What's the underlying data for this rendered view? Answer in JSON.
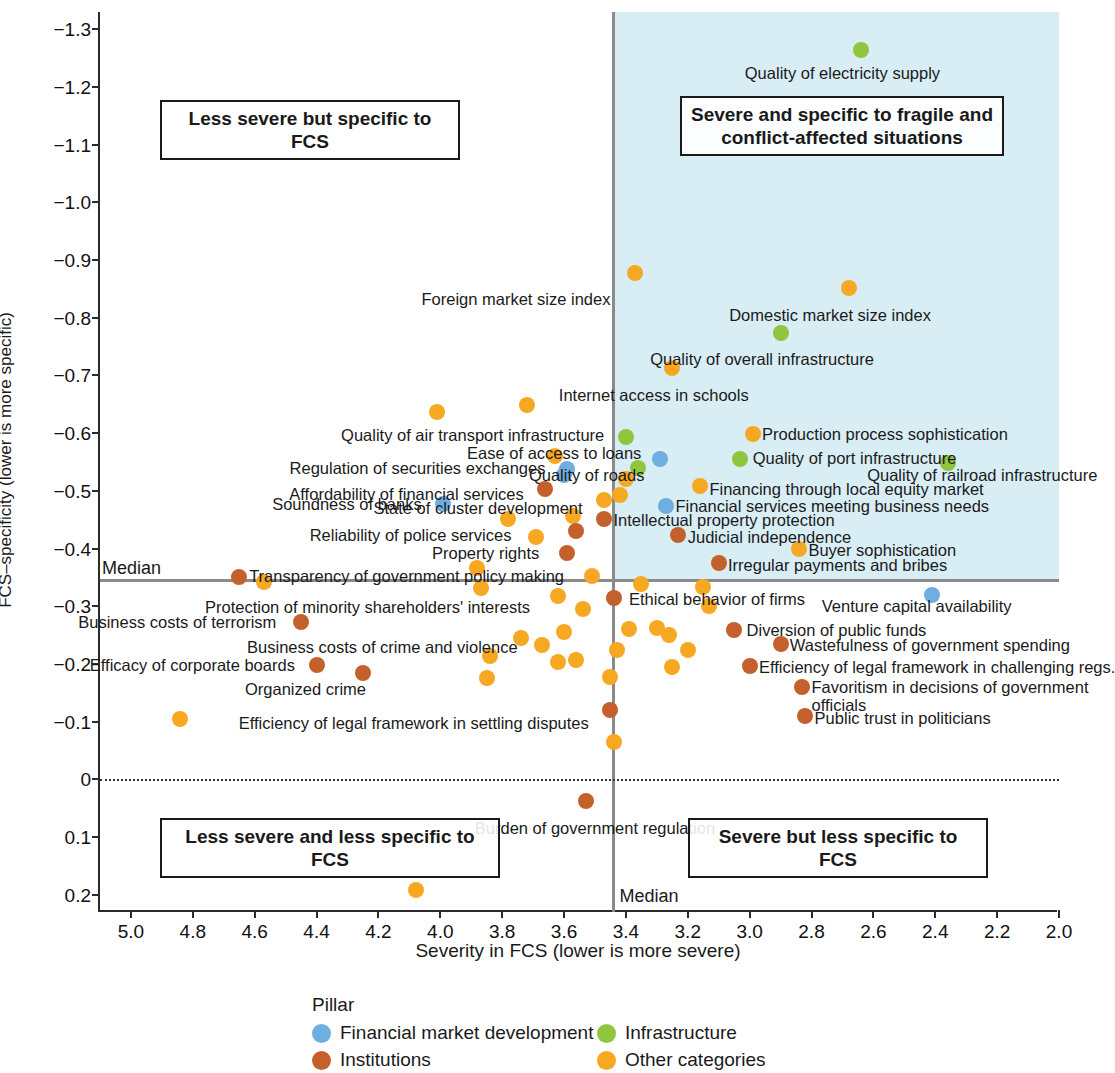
{
  "chart_data": {
    "type": "scatter",
    "title": "",
    "xlabel": "Severity in FCS (lower is more severe)",
    "ylabel": "FCS–specificity (lower is more specific)",
    "xlim": [
      5.1,
      2.0
    ],
    "ylim": [
      -1.33,
      0.23
    ],
    "x_ticks": [
      "5.0",
      "4.8",
      "4.6",
      "4.4",
      "4.2",
      "4.0",
      "3.8",
      "3.6",
      "3.4",
      "3.2",
      "3.0",
      "2.8",
      "2.6",
      "2.4",
      "2.2",
      "2.0"
    ],
    "x_tick_values": [
      5.0,
      4.8,
      4.6,
      4.4,
      4.2,
      4.0,
      3.8,
      3.6,
      3.4,
      3.2,
      3.0,
      2.8,
      2.6,
      2.4,
      2.2,
      2.0
    ],
    "y_ticks": [
      "−1.3",
      "−1.2",
      "−1.1",
      "−1.0",
      "−0.9",
      "−0.8",
      "−0.7",
      "−0.6",
      "−0.5",
      "−0.4",
      "−0.3",
      "−0.2",
      "−0.1",
      "0",
      "0.1",
      "0.2"
    ],
    "y_tick_values": [
      -1.3,
      -1.2,
      -1.1,
      -1.0,
      -0.9,
      -0.8,
      -0.7,
      -0.6,
      -0.5,
      -0.4,
      -0.3,
      -0.2,
      -0.1,
      0,
      0.1,
      0.2
    ],
    "grid": false,
    "median_x": 3.44,
    "median_y": -0.345,
    "median_label": "Median",
    "zero_line_y": 0,
    "legend_position": "bottom",
    "legend_title": "Pillar",
    "series": [
      {
        "name": "Financial market development",
        "color": "#6FAEE0"
      },
      {
        "name": "Infrastructure",
        "color": "#8FC63D"
      },
      {
        "name": "Institutions",
        "color": "#C4602B"
      },
      {
        "name": "Other categories",
        "color": "#F7A823"
      }
    ],
    "quadrants": [
      {
        "id": "top-left",
        "text": "Less severe but specific to FCS"
      },
      {
        "id": "top-right",
        "text": "Severe and specific to fragile and\nconflict-affected situations"
      },
      {
        "id": "bottom-left",
        "text": "Less severe and less specific to FCS"
      },
      {
        "id": "bottom-right",
        "text": "Severe but less specific to FCS"
      }
    ],
    "points": [
      {
        "label": "Quality of electricity supply",
        "series": "Infrastructure",
        "x": 2.64,
        "y": -1.265,
        "lx": 2.7,
        "ly": -1.225,
        "anchor": "c"
      },
      {
        "label": "Foreign market size index",
        "series": "Other categories",
        "x": 3.37,
        "y": -0.877,
        "lx": 3.45,
        "ly": -0.832,
        "anchor": "r"
      },
      {
        "label": "Domestic market size index",
        "series": "Other categories",
        "x": 2.68,
        "y": -0.852,
        "lx": 2.74,
        "ly": -0.805,
        "anchor": "c"
      },
      {
        "label": "Quality of overall infrastructure",
        "series": "Infrastructure",
        "x": 2.9,
        "y": -0.773,
        "lx": 2.96,
        "ly": -0.728,
        "anchor": "c"
      },
      {
        "label": "Internet access in schools",
        "series": "Other categories",
        "x": 3.25,
        "y": -0.713,
        "lx": 3.31,
        "ly": -0.667,
        "anchor": "c"
      },
      {
        "label": "Quality of air transport infrastructure",
        "series": "Infrastructure",
        "x": 3.4,
        "y": -0.593,
        "lx": 3.47,
        "ly": -0.596,
        "anchor": "r"
      },
      {
        "label": "Production process sophistication",
        "series": "Other categories",
        "x": 2.99,
        "y": -0.598,
        "lx": 2.96,
        "ly": -0.598,
        "anchor": "l"
      },
      {
        "label": "Ease of access to loans",
        "series": "Financial market development",
        "x": 3.29,
        "y": -0.555,
        "lx": 3.35,
        "ly": -0.565,
        "anchor": "r"
      },
      {
        "label": "Quality of port infrastructure",
        "series": "Infrastructure",
        "x": 3.03,
        "y": -0.556,
        "lx": 2.99,
        "ly": -0.557,
        "anchor": "l"
      },
      {
        "label": "Quality of railroad infrastructure",
        "series": "Infrastructure",
        "x": 2.36,
        "y": -0.548,
        "lx": 2.62,
        "ly": -0.528,
        "anchor": "l"
      },
      {
        "label": "Quality of roads",
        "series": "Infrastructure",
        "x": 3.36,
        "y": -0.54,
        "lx": 3.34,
        "ly": -0.528,
        "anchor": "r"
      },
      {
        "label": "Regulation of securities exchanges",
        "series": "Financial market development",
        "x": 3.59,
        "y": -0.538,
        "lx": 3.66,
        "ly": -0.54,
        "anchor": "r"
      },
      {
        "label": "Financing through local equity market",
        "series": "Other categories",
        "x": 3.16,
        "y": -0.508,
        "lx": 3.13,
        "ly": -0.503,
        "anchor": "l"
      },
      {
        "label": "Affordability of financial services",
        "series": "Institutions",
        "x": 3.66,
        "y": -0.503,
        "lx": 3.73,
        "ly": -0.494,
        "anchor": "r"
      },
      {
        "label": "State of cluster development",
        "series": "Other categories",
        "x": 3.47,
        "y": -0.485,
        "lx": 3.54,
        "ly": -0.471,
        "anchor": "r"
      },
      {
        "label": "Financial services meeting business needs",
        "series": "Financial market development",
        "x": 3.27,
        "y": -0.474,
        "lx": 3.24,
        "ly": -0.473,
        "anchor": "l"
      },
      {
        "label": "Soundness of banks",
        "series": "Financial market development",
        "x": 3.99,
        "y": -0.478,
        "lx": 4.06,
        "ly": -0.478,
        "anchor": "r"
      },
      {
        "label": "Intellectual property protection",
        "series": "Institutions",
        "x": 3.47,
        "y": -0.452,
        "lx": 3.44,
        "ly": -0.449,
        "anchor": "l"
      },
      {
        "label": "Reliability of police services",
        "series": "Other categories",
        "x": 3.69,
        "y": -0.42,
        "lx": 3.77,
        "ly": -0.423,
        "anchor": "r"
      },
      {
        "label": "Judicial independence",
        "series": "Institutions",
        "x": 3.23,
        "y": -0.424,
        "lx": 3.2,
        "ly": -0.42,
        "anchor": "l"
      },
      {
        "label": "Buyer sophistication",
        "series": "Other categories",
        "x": 2.84,
        "y": -0.4,
        "lx": 2.81,
        "ly": -0.398,
        "anchor": "l"
      },
      {
        "label": "Property rights",
        "series": "Institutions",
        "x": 3.59,
        "y": -0.392,
        "lx": 3.68,
        "ly": -0.392,
        "anchor": "r"
      },
      {
        "label": "Irregular payments and bribes",
        "series": "Institutions",
        "x": 3.1,
        "y": -0.375,
        "lx": 3.07,
        "ly": -0.372,
        "anchor": "l"
      },
      {
        "label": "Transparency of government policy making",
        "series": "Other categories",
        "x": 3.51,
        "y": -0.353,
        "lx": 3.6,
        "ly": -0.353,
        "anchor": "r"
      },
      {
        "label": "Ethical behavior of firms",
        "series": "Institutions",
        "x": 3.44,
        "y": -0.315,
        "lx": 3.39,
        "ly": -0.313,
        "anchor": "l"
      },
      {
        "label": "Venture capital availability",
        "series": "Financial market development",
        "x": 2.41,
        "y": -0.32,
        "lx": 2.46,
        "ly": -0.3,
        "anchor": "c"
      },
      {
        "label": "Protection of minority shareholders' interests",
        "series": "Other categories",
        "x": 3.62,
        "y": -0.318,
        "lx": 3.71,
        "ly": -0.298,
        "anchor": "r"
      },
      {
        "label": "Diversion of public funds",
        "series": "Institutions",
        "x": 3.05,
        "y": -0.259,
        "lx": 3.01,
        "ly": -0.259,
        "anchor": "l"
      },
      {
        "label": "Business costs of terrorism",
        "series": "Institutions",
        "x": 4.45,
        "y": -0.272,
        "lx": 4.53,
        "ly": -0.272,
        "anchor": "r"
      },
      {
        "label": "Wastefulness of government spending",
        "series": "Institutions",
        "x": 2.9,
        "y": -0.234,
        "lx": 2.87,
        "ly": -0.233,
        "anchor": "l"
      },
      {
        "label": "Business costs of crime and violence",
        "series": "Other categories",
        "x": 3.67,
        "y": -0.233,
        "lx": 3.75,
        "ly": -0.229,
        "anchor": "r"
      },
      {
        "label": "Efficacy of corporate boards",
        "series": "Institutions",
        "x": 4.4,
        "y": -0.199,
        "lx": 4.47,
        "ly": -0.199,
        "anchor": "r"
      },
      {
        "label": "Efficiency of legal framework in challenging regs.",
        "series": "Institutions",
        "x": 3.0,
        "y": -0.196,
        "lx": 2.97,
        "ly": -0.195,
        "anchor": "l"
      },
      {
        "label": "Organized crime",
        "series": "Institutions",
        "x": 4.25,
        "y": -0.184,
        "lx": 4.24,
        "ly": -0.156,
        "anchor": "r"
      },
      {
        "label": "Favoritism in decisions of government\nofficials",
        "series": "Institutions",
        "x": 2.83,
        "y": -0.16,
        "lx": 2.8,
        "ly": -0.145,
        "anchor": "l"
      },
      {
        "label": "Public trust in politicians",
        "series": "Institutions",
        "x": 2.82,
        "y": -0.11,
        "lx": 2.79,
        "ly": -0.107,
        "anchor": "l"
      },
      {
        "label": "Efficiency of legal framework in settling disputes",
        "series": "Institutions",
        "x": 3.45,
        "y": -0.12,
        "lx": 3.52,
        "ly": -0.097,
        "anchor": "r"
      },
      {
        "label": "Burden of government regulation",
        "series": "Institutions",
        "x": 3.53,
        "y": 0.037,
        "lx": 3.5,
        "ly": 0.085,
        "anchor": "c"
      },
      {
        "label": "",
        "series": "Other categories",
        "x": 4.01,
        "y": -0.637,
        "lx": 0,
        "ly": 0,
        "anchor": "c"
      },
      {
        "label": "",
        "series": "Other categories",
        "x": 3.72,
        "y": -0.648,
        "lx": 0,
        "ly": 0,
        "anchor": "c"
      },
      {
        "label": "",
        "series": "Other categories",
        "x": 3.63,
        "y": -0.56,
        "lx": 0,
        "ly": 0,
        "anchor": "c"
      },
      {
        "label": "",
        "series": "Financial market development",
        "x": 3.6,
        "y": -0.527,
        "lx": 0,
        "ly": 0,
        "anchor": "c"
      },
      {
        "label": "",
        "series": "Other categories",
        "x": 3.4,
        "y": -0.52,
        "lx": 0,
        "ly": 0,
        "anchor": "c"
      },
      {
        "label": "",
        "series": "Other categories",
        "x": 3.42,
        "y": -0.493,
        "lx": 0,
        "ly": 0,
        "anchor": "c"
      },
      {
        "label": "",
        "series": "Other categories",
        "x": 3.78,
        "y": -0.452,
        "lx": 0,
        "ly": 0,
        "anchor": "c"
      },
      {
        "label": "",
        "series": "Other categories",
        "x": 3.57,
        "y": -0.456,
        "lx": 0,
        "ly": 0,
        "anchor": "c"
      },
      {
        "label": "",
        "series": "Institutions",
        "x": 3.56,
        "y": -0.431,
        "lx": 0,
        "ly": 0,
        "anchor": "c"
      },
      {
        "label": "",
        "series": "Other categories",
        "x": 3.88,
        "y": -0.367,
        "lx": 0,
        "ly": 0,
        "anchor": "c"
      },
      {
        "label": "",
        "series": "Institutions",
        "x": 4.65,
        "y": -0.35,
        "lx": 0,
        "ly": 0,
        "anchor": "c"
      },
      {
        "label": "",
        "series": "Other categories",
        "x": 4.57,
        "y": -0.342,
        "lx": 0,
        "ly": 0,
        "anchor": "c"
      },
      {
        "label": "",
        "series": "Other categories",
        "x": 3.35,
        "y": -0.339,
        "lx": 0,
        "ly": 0,
        "anchor": "c"
      },
      {
        "label": "",
        "series": "Other categories",
        "x": 3.15,
        "y": -0.333,
        "lx": 0,
        "ly": 0,
        "anchor": "c"
      },
      {
        "label": "",
        "series": "Other categories",
        "x": 3.54,
        "y": -0.296,
        "lx": 0,
        "ly": 0,
        "anchor": "c"
      },
      {
        "label": "",
        "series": "Other categories",
        "x": 3.87,
        "y": -0.332,
        "lx": 0,
        "ly": 0,
        "anchor": "c"
      },
      {
        "label": "",
        "series": "Other categories",
        "x": 3.13,
        "y": -0.3,
        "lx": 0,
        "ly": 0,
        "anchor": "c"
      },
      {
        "label": "",
        "series": "Other categories",
        "x": 3.6,
        "y": -0.255,
        "lx": 0,
        "ly": 0,
        "anchor": "c"
      },
      {
        "label": "",
        "series": "Other categories",
        "x": 3.74,
        "y": -0.245,
        "lx": 0,
        "ly": 0,
        "anchor": "c"
      },
      {
        "label": "",
        "series": "Other categories",
        "x": 3.39,
        "y": -0.261,
        "lx": 0,
        "ly": 0,
        "anchor": "c"
      },
      {
        "label": "",
        "series": "Other categories",
        "x": 3.3,
        "y": -0.262,
        "lx": 0,
        "ly": 0,
        "anchor": "c"
      },
      {
        "label": "",
        "series": "Other categories",
        "x": 3.26,
        "y": -0.25,
        "lx": 0,
        "ly": 0,
        "anchor": "c"
      },
      {
        "label": "",
        "series": "Other categories",
        "x": 3.2,
        "y": -0.225,
        "lx": 0,
        "ly": 0,
        "anchor": "c"
      },
      {
        "label": "",
        "series": "Other categories",
        "x": 3.43,
        "y": -0.224,
        "lx": 0,
        "ly": 0,
        "anchor": "c"
      },
      {
        "label": "",
        "series": "Other categories",
        "x": 3.84,
        "y": -0.213,
        "lx": 0,
        "ly": 0,
        "anchor": "c"
      },
      {
        "label": "",
        "series": "Other categories",
        "x": 3.85,
        "y": -0.176,
        "lx": 0,
        "ly": 0,
        "anchor": "c"
      },
      {
        "label": "",
        "series": "Other categories",
        "x": 3.62,
        "y": -0.204,
        "lx": 0,
        "ly": 0,
        "anchor": "c"
      },
      {
        "label": "",
        "series": "Other categories",
        "x": 3.56,
        "y": -0.207,
        "lx": 0,
        "ly": 0,
        "anchor": "c"
      },
      {
        "label": "",
        "series": "Other categories",
        "x": 3.25,
        "y": -0.194,
        "lx": 0,
        "ly": 0,
        "anchor": "c"
      },
      {
        "label": "",
        "series": "Other categories",
        "x": 3.45,
        "y": -0.178,
        "lx": 0,
        "ly": 0,
        "anchor": "c"
      },
      {
        "label": "",
        "series": "Other categories",
        "x": 4.84,
        "y": -0.105,
        "lx": 0,
        "ly": 0,
        "anchor": "c"
      },
      {
        "label": "",
        "series": "Other categories",
        "x": 3.44,
        "y": -0.065,
        "lx": 0,
        "ly": 0,
        "anchor": "c"
      },
      {
        "label": "",
        "series": "Other categories",
        "x": 4.08,
        "y": 0.191,
        "lx": 0,
        "ly": 0,
        "anchor": "c"
      }
    ]
  }
}
